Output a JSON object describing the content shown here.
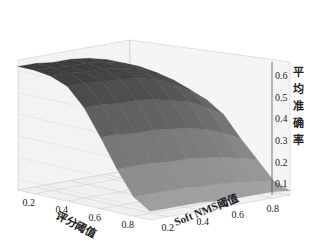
{
  "chart_data": {
    "type": "surface3d",
    "title": "",
    "xlabel": "评分阈值",
    "ylabel": "Soft NMS阈值",
    "zlabel": "平均准确率",
    "x_ticks": [
      "0.2",
      "0.4",
      "0.6",
      "0.8"
    ],
    "y_ticks": [
      "0.2",
      "0.4",
      "0.6",
      "0.8"
    ],
    "z_ticks": [
      "0.1",
      "0.2",
      "0.3",
      "0.4",
      "0.5",
      "0.6"
    ],
    "xlim": [
      0.1,
      0.9
    ],
    "ylim": [
      0.1,
      0.9
    ],
    "zlim": [
      0.05,
      0.65
    ],
    "grid": true,
    "colormap": "gray",
    "x": [
      0.1,
      0.2,
      0.3,
      0.4,
      0.5,
      0.6,
      0.7,
      0.8,
      0.9
    ],
    "y": [
      0.1,
      0.2,
      0.3,
      0.4,
      0.5,
      0.6,
      0.7,
      0.8,
      0.9
    ],
    "z_description": "平均准确率 ≈ 0.6 plateau for low Soft NMS阈值 (≈0.1–0.5), decreasing steeply near high Soft NMS阈值; falls to ≈0.08 at high 评分阈值",
    "z": [
      [
        0.62,
        0.62,
        0.61,
        0.61,
        0.6,
        0.58,
        0.55,
        0.5,
        0.45
      ],
      [
        0.62,
        0.62,
        0.61,
        0.61,
        0.6,
        0.58,
        0.55,
        0.5,
        0.44
      ],
      [
        0.61,
        0.61,
        0.6,
        0.6,
        0.59,
        0.57,
        0.54,
        0.49,
        0.43
      ],
      [
        0.58,
        0.58,
        0.57,
        0.57,
        0.56,
        0.54,
        0.51,
        0.46,
        0.4
      ],
      [
        0.5,
        0.5,
        0.49,
        0.49,
        0.48,
        0.46,
        0.44,
        0.4,
        0.35
      ],
      [
        0.38,
        0.38,
        0.37,
        0.37,
        0.36,
        0.35,
        0.33,
        0.3,
        0.26
      ],
      [
        0.25,
        0.25,
        0.25,
        0.24,
        0.24,
        0.23,
        0.22,
        0.2,
        0.18
      ],
      [
        0.14,
        0.14,
        0.14,
        0.14,
        0.13,
        0.13,
        0.12,
        0.11,
        0.1
      ],
      [
        0.09,
        0.09,
        0.09,
        0.09,
        0.08,
        0.08,
        0.08,
        0.08,
        0.07
      ]
    ]
  }
}
